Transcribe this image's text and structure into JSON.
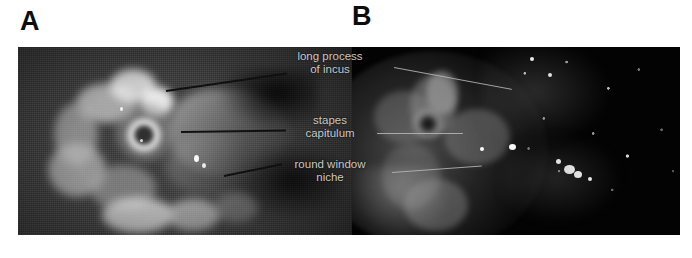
{
  "figure": {
    "panels": [
      {
        "letter": "A",
        "name": "white-light-endoscopic-view",
        "modality": "grayscale white-light endoscopy"
      },
      {
        "letter": "B",
        "name": "fluorescence-endoscopic-view",
        "modality": "near-infrared fluorescence endoscopy"
      }
    ],
    "annotations": [
      {
        "id": "long-process-of-incus",
        "line1": "long process",
        "line2": "of incus"
      },
      {
        "id": "stapes-capitulum",
        "line1": "stapes",
        "line2": "capitulum"
      },
      {
        "id": "round-window-niche",
        "line1": "round window",
        "line2": "niche"
      }
    ],
    "colors": {
      "background": "#ffffff",
      "panel_letter": "#0d0d0d",
      "annotation_text": "#c9c9c9",
      "leader_line_panel_a": "#101010",
      "leader_line_panel_b": "#b9b9b9",
      "panel_a_background": "#3a3a3a",
      "panel_b_background": "#030303"
    }
  }
}
